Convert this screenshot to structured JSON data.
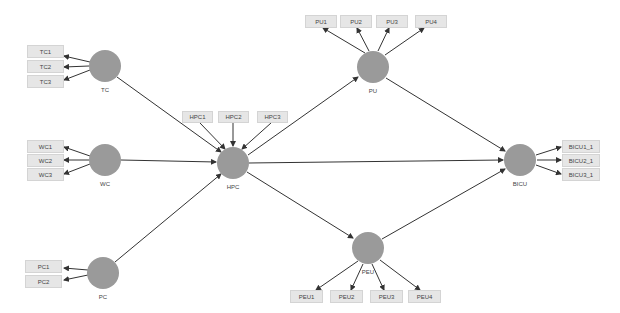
{
  "diagram": {
    "type": "structural-equation-model",
    "colors": {
      "latent_fill": "#9a9a9a",
      "indicator_fill": "#e6e6e6",
      "indicator_border": "#d4d4d4",
      "arrow": "#333333"
    },
    "latent_variables": [
      {
        "id": "TC",
        "label": "TC",
        "cx": 105,
        "cy": 66
      },
      {
        "id": "WC",
        "label": "WC",
        "cx": 105,
        "cy": 160
      },
      {
        "id": "PC",
        "label": "PC",
        "cx": 103,
        "cy": 273
      },
      {
        "id": "HPC",
        "label": "HPC",
        "cx": 233,
        "cy": 163
      },
      {
        "id": "PU",
        "label": "PU",
        "cx": 373,
        "cy": 67
      },
      {
        "id": "PEU",
        "label": "PEU",
        "cx": 368,
        "cy": 248
      },
      {
        "id": "BICU",
        "label": "BICU",
        "cx": 520,
        "cy": 160
      }
    ],
    "indicators": {
      "TC": [
        "TC1",
        "TC2",
        "TC3"
      ],
      "WC": [
        "WC1",
        "WC2",
        "WC3"
      ],
      "PC": [
        "PC1",
        "PC2"
      ],
      "HPC": [
        "HPC1",
        "HPC2",
        "HPC3"
      ],
      "PU": [
        "PU1",
        "PU2",
        "PU3",
        "PU4"
      ],
      "PEU": [
        "PEU1",
        "PEU2",
        "PEU3",
        "PEU4"
      ],
      "BICU": [
        "BICU1_1",
        "BICU2_1",
        "BICU3_1"
      ]
    },
    "structural_paths": [
      {
        "from": "TC",
        "to": "HPC"
      },
      {
        "from": "WC",
        "to": "HPC"
      },
      {
        "from": "PC",
        "to": "HPC"
      },
      {
        "from": "HPC",
        "to": "PU"
      },
      {
        "from": "HPC",
        "to": "PEU"
      },
      {
        "from": "HPC",
        "to": "BICU"
      },
      {
        "from": "PU",
        "to": "BICU"
      },
      {
        "from": "PEU",
        "to": "BICU"
      }
    ]
  },
  "labels": {
    "tc": "TC",
    "wc": "WC",
    "pc": "PC",
    "hpc": "HPC",
    "pu": "PU",
    "peu": "PEU",
    "bicu": "BICU",
    "tc1": "TC1",
    "tc2": "TC2",
    "tc3": "TC3",
    "wc1": "WC1",
    "wc2": "WC2",
    "wc3": "WC3",
    "pc1": "PC1",
    "pc2": "PC2",
    "hpc1": "HPC1",
    "hpc2": "HPC2",
    "hpc3": "HPC3",
    "pu1": "PU1",
    "pu2": "PU2",
    "pu3": "PU3",
    "pu4": "PU4",
    "peu1": "PEU1",
    "peu2": "PEU2",
    "peu3": "PEU3",
    "peu4": "PEU4",
    "bicu1": "BICU1_1",
    "bicu2": "BICU2_1",
    "bicu3": "BICU3_1"
  }
}
